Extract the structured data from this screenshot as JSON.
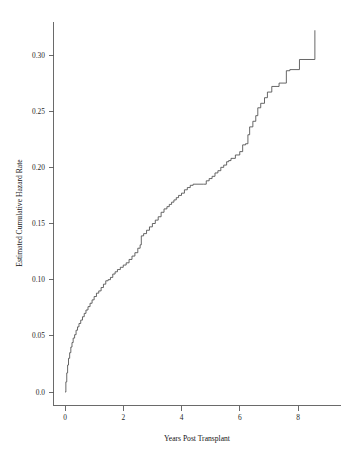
{
  "chart_data": {
    "type": "line",
    "title": "",
    "subtitle": "",
    "xlabel": "Years Post Transplant",
    "ylabel": "Estimated Cumulative Hazard Rate",
    "xlim": [
      -0.35,
      9.5
    ],
    "ylim": [
      -0.012,
      0.335
    ],
    "xticks": [
      0,
      2,
      4,
      6,
      8
    ],
    "xticklabels": [
      "0",
      "2",
      "4",
      "6",
      "8"
    ],
    "yticks": [
      0.0,
      0.05,
      0.1,
      0.15,
      0.2,
      0.25,
      0.3
    ],
    "yticklabels": [
      "0.0",
      "0.05",
      "0.10",
      "0.15",
      "0.20",
      "0.25",
      "0.30"
    ],
    "grid": false,
    "legend": null,
    "step_style": "post",
    "line_color": "#4b4b4b",
    "series": [
      {
        "name": "Estimated cumulative hazard (Nelson-Aalen)",
        "x": [
          0.0,
          0.03,
          0.06,
          0.09,
          0.12,
          0.16,
          0.2,
          0.24,
          0.28,
          0.33,
          0.38,
          0.43,
          0.48,
          0.54,
          0.6,
          0.66,
          0.72,
          0.79,
          0.86,
          0.93,
          1.0,
          1.08,
          1.16,
          1.24,
          1.32,
          1.4,
          1.48,
          1.56,
          1.64,
          1.72,
          1.8,
          1.9,
          2.0,
          2.1,
          2.2,
          2.3,
          2.4,
          2.5,
          2.58,
          2.62,
          2.7,
          2.8,
          2.9,
          3.0,
          3.1,
          3.2,
          3.3,
          3.4,
          3.5,
          3.58,
          3.66,
          3.74,
          3.82,
          3.9,
          4.0,
          4.1,
          4.2,
          4.3,
          4.4,
          4.75,
          4.85,
          4.95,
          5.05,
          5.15,
          5.25,
          5.35,
          5.45,
          5.55,
          5.62,
          5.7,
          5.85,
          6.0,
          6.1,
          6.2,
          6.28,
          6.34,
          6.45,
          6.55,
          6.62,
          6.72,
          6.85,
          6.95,
          7.1,
          7.35,
          7.6,
          7.72,
          8.05,
          8.55,
          8.58
        ],
        "y": [
          0.0,
          0.009,
          0.017,
          0.024,
          0.03,
          0.035,
          0.04,
          0.044,
          0.048,
          0.051,
          0.055,
          0.058,
          0.061,
          0.064,
          0.067,
          0.07,
          0.073,
          0.076,
          0.079,
          0.082,
          0.085,
          0.088,
          0.09,
          0.093,
          0.096,
          0.099,
          0.1,
          0.102,
          0.105,
          0.107,
          0.109,
          0.111,
          0.113,
          0.115,
          0.118,
          0.121,
          0.124,
          0.128,
          0.131,
          0.139,
          0.141,
          0.144,
          0.147,
          0.15,
          0.153,
          0.156,
          0.16,
          0.163,
          0.165,
          0.167,
          0.169,
          0.171,
          0.173,
          0.175,
          0.177,
          0.18,
          0.182,
          0.184,
          0.185,
          0.185,
          0.188,
          0.19,
          0.192,
          0.195,
          0.197,
          0.2,
          0.202,
          0.205,
          0.206,
          0.208,
          0.211,
          0.214,
          0.22,
          0.221,
          0.229,
          0.236,
          0.241,
          0.246,
          0.253,
          0.257,
          0.262,
          0.267,
          0.272,
          0.275,
          0.286,
          0.287,
          0.296,
          0.296,
          0.322
        ]
      }
    ]
  },
  "axis": {
    "x_title": "Years Post Transplant",
    "y_title": "Estimated Cumulative Hazard Rate"
  }
}
